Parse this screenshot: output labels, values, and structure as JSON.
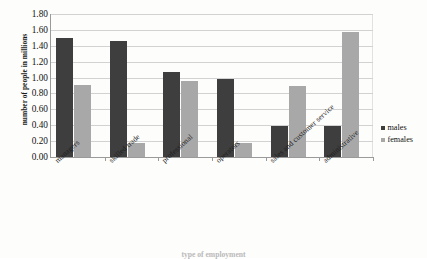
{
  "chart_data": {
    "type": "bar",
    "title": "",
    "xlabel": "type of employment",
    "ylabel": "number of people in millions",
    "categories": [
      "managers",
      "skilled trade",
      "professional",
      "operators",
      "sales and customer service",
      "administrative"
    ],
    "series": [
      {
        "name": "males",
        "color": "#3e3e3e",
        "values": [
          1.5,
          1.46,
          1.07,
          0.98,
          0.39,
          0.39
        ]
      },
      {
        "name": "females",
        "color": "#a8a8a8",
        "values": [
          0.91,
          0.18,
          0.96,
          0.18,
          0.89,
          1.57
        ]
      }
    ],
    "ylim": [
      0.0,
      1.8
    ],
    "ystep": 0.2,
    "ytick_labels": [
      "1.80",
      "1.60",
      "1.40",
      "1.20",
      "1.00",
      "0.80",
      "0.60",
      "0.40",
      "0.20",
      "0.00"
    ],
    "grid": "horizontal",
    "legend_position": "right"
  },
  "legend": {
    "entries": [
      {
        "label": "males"
      },
      {
        "label": "females"
      }
    ]
  }
}
